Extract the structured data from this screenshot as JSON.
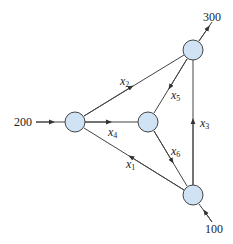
{
  "diagram": {
    "type": "network-flow",
    "colors": {
      "node_fill": "#cfe3f5",
      "node_stroke": "#444444",
      "edge": "#444444",
      "text": "#222222"
    },
    "nodes": [
      {
        "id": "left",
        "cx": 75,
        "cy": 122
      },
      {
        "id": "center",
        "cx": 148,
        "cy": 122
      },
      {
        "id": "top_right",
        "cx": 193,
        "cy": 50
      },
      {
        "id": "bottom_right",
        "cx": 193,
        "cy": 195
      }
    ],
    "external_flows": {
      "inflow_left": "200",
      "outflow_top": "300",
      "inflow_bottom": "100"
    },
    "edges": [
      {
        "var": "x",
        "sub": "1",
        "from": "bottom_right",
        "to": "left"
      },
      {
        "var": "x",
        "sub": "2",
        "from": "left",
        "to": "top_right"
      },
      {
        "var": "x",
        "sub": "3",
        "from": "bottom_right",
        "to": "top_right"
      },
      {
        "var": "x",
        "sub": "4",
        "from": "left",
        "to": "center"
      },
      {
        "var": "x",
        "sub": "5",
        "from": "top_right",
        "to": "center"
      },
      {
        "var": "x",
        "sub": "6",
        "from": "center",
        "to": "bottom_right"
      }
    ]
  }
}
